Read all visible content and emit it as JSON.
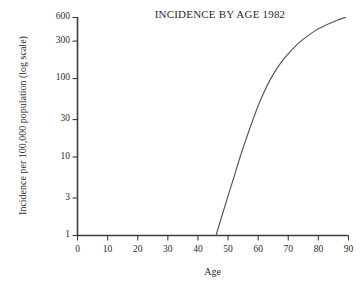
{
  "chart_data": {
    "type": "line",
    "title": "INCIDENCE BY AGE 1982",
    "xlabel": "Age",
    "ylabel": "Incidence per 100,000 population (log scale)",
    "yscale": "log",
    "xlim": [
      0,
      90
    ],
    "ylim": [
      1,
      600
    ],
    "grid": false,
    "legend": null,
    "xticks": [
      0,
      10,
      20,
      30,
      40,
      50,
      60,
      70,
      80,
      90
    ],
    "xtick_labels": [
      "0",
      "10",
      "20",
      "30",
      "40",
      "50",
      "60",
      "70",
      "80",
      "90"
    ],
    "yticks": [
      1,
      3,
      10,
      30,
      100,
      300,
      600
    ],
    "ytick_labels": [
      "1",
      "3",
      "10",
      "30",
      "100",
      "300",
      "600"
    ],
    "series": [
      {
        "name": "Incidence",
        "x": [
          46,
          48,
          50,
          52,
          54,
          56,
          58,
          60,
          62,
          64,
          66,
          68,
          70,
          72,
          74,
          76,
          78,
          80,
          82,
          84,
          86,
          88,
          89
        ],
        "y": [
          1.0,
          1.8,
          3.2,
          5.6,
          10.0,
          17.0,
          28.0,
          45.0,
          68.0,
          97.0,
          130.0,
          168.0,
          207.0,
          250.0,
          295.0,
          340.0,
          385.0,
          430.0,
          470.0,
          510.0,
          550.0,
          585.0,
          600.0
        ]
      }
    ],
    "annotations": []
  },
  "figure": {
    "background_color": "#ffffff",
    "line_color": "#4a4a4a",
    "axis_color": "#3c3c3c",
    "text_color": "#2b2b2b"
  }
}
